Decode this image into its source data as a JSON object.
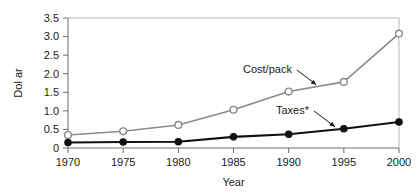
{
  "chart_data": {
    "type": "line",
    "title": "",
    "xlabel": "Year",
    "ylabel": "Dol ar",
    "x": [
      1970,
      1975,
      1980,
      1985,
      1990,
      1995,
      2000
    ],
    "xtick_labels": [
      "1970",
      "1975",
      "1980",
      "1985",
      "1990",
      "1995",
      "2000"
    ],
    "ytick_labels": [
      "0",
      "0.5",
      "1.0",
      "1.5",
      "2.0",
      "2.5",
      "3.0",
      "3.5"
    ],
    "ytick_values": [
      0,
      0.5,
      1.0,
      1.5,
      2.0,
      2.5,
      3.0,
      3.5
    ],
    "xlim": [
      1970,
      2000
    ],
    "ylim": [
      0,
      3.5
    ],
    "grid": false,
    "legend_position": "inline-annotation",
    "series": [
      {
        "name": "Cost/pack",
        "values": [
          0.35,
          0.45,
          0.62,
          1.03,
          1.52,
          1.78,
          3.08
        ],
        "color": "#8a8a8a",
        "marker": "open-circle",
        "marker_fill": "#ffffff"
      },
      {
        "name": "Taxes*",
        "values": [
          0.15,
          0.16,
          0.17,
          0.3,
          0.37,
          0.52,
          0.7
        ],
        "color": "#111111",
        "marker": "filled-circle",
        "marker_fill": "#111111"
      }
    ],
    "annotations": [
      {
        "text": "Cost/pack",
        "series": "Cost/pack"
      },
      {
        "text": "Taxes*",
        "series": "Taxes*"
      }
    ]
  },
  "colors": {
    "background": "#ffffff",
    "frame": "#b9b9b9",
    "axis": "#6e6e6e",
    "text": "#1a1a1a",
    "cost_line": "#8a8a8a",
    "taxes_line": "#111111"
  }
}
